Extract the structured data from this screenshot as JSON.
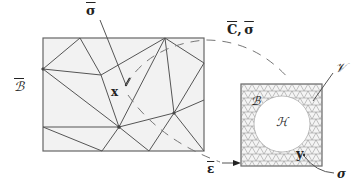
{
  "labels": {
    "sigma_bar": "σ",
    "B_bar": "ℬ",
    "x": "x",
    "C_sigma": "C, σ",
    "C_part": "C",
    "sigma_part": "σ",
    "eps_bar": "ε",
    "V": "𝒱",
    "B": "ℬ",
    "H": "ℋ",
    "y": "y",
    "sigma": "σ"
  },
  "colors": {
    "mesh_fill": "#f2f2f2",
    "line": "#555555",
    "text": "#222222"
  }
}
